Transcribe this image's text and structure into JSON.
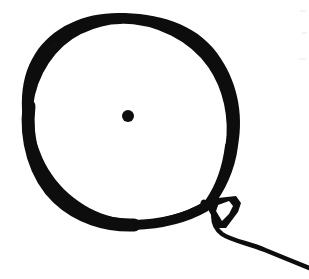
{
  "page": {
    "width": 309,
    "height": 279,
    "background_color": "#ffffff",
    "ink_color": "#0d0d0d",
    "style": "hand-drawn monochrome sketch"
  },
  "artwork": {
    "subject": "balloon",
    "alt_text": "Hand-drawn black ink outline of a balloon with a knot and a trailing string",
    "elements": [
      {
        "name": "balloon-body",
        "description": "irregular hand-drawn oval outline, thickest along lower-left arc",
        "bounds": {
          "x_min": 25,
          "y_min": 20,
          "x_max": 232,
          "y_max": 226
        },
        "stroke_min_width": 6,
        "stroke_max_width": 14,
        "filled": false
      },
      {
        "name": "balloon-center-dot",
        "description": "small solid ink dot near the middle of the balloon",
        "center_x": 128,
        "center_y": 116,
        "radius": 6,
        "filled": true
      },
      {
        "name": "balloon-knot",
        "description": "small downward-pointing triangular knot with a white V-shaped void inside",
        "bounds": {
          "x_min": 208,
          "y_min": 196,
          "x_max": 242,
          "y_max": 230
        },
        "filled": true
      },
      {
        "name": "balloon-string",
        "description": "curving tail descending from the knot, flattening then sloping down-right off the right edge",
        "start_x": 218,
        "start_y": 226,
        "end_x": 309,
        "end_y": 266,
        "stroke_width": 4
      }
    ]
  },
  "colors": {
    "ink": "#0d0d0d",
    "paper": "#ffffff",
    "scan_speck": "#f4f4f4"
  }
}
